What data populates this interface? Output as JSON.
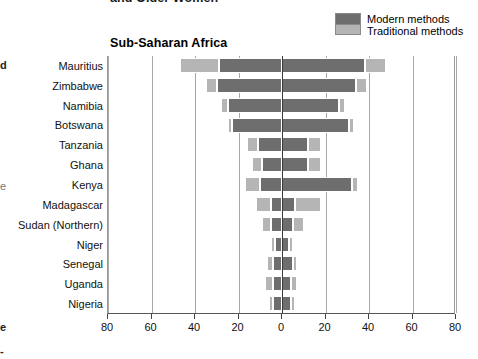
{
  "page": {
    "cutoff_title": "and Older Women",
    "edge_fragments": [
      "d",
      "e",
      "e",
      "-"
    ]
  },
  "legend": {
    "position": "top-right",
    "items": [
      {
        "label": "Modern methods",
        "color": "#6e6e6e",
        "swatch_name": "modern-methods-swatch"
      },
      {
        "label": "Traditional methods",
        "color": "#b5b5b5",
        "swatch_name": "traditional-methods-swatch"
      }
    ]
  },
  "chart_data": {
    "type": "bar",
    "orientation": "horizontal-diverging",
    "title": "Sub-Saharan Africa",
    "xlabel": "",
    "ylabel": "",
    "xlim": [
      -80,
      80
    ],
    "xticks": [
      -80,
      -60,
      -40,
      -20,
      0,
      20,
      40,
      60,
      80
    ],
    "xticklabels": [
      "80",
      "60",
      "40",
      "20",
      "0",
      "20",
      "40",
      "60",
      "80"
    ],
    "grid": true,
    "legend_entries": [
      "Modern methods",
      "Traditional methods"
    ],
    "categories": [
      "Mauritius",
      "Zimbabwe",
      "Namibia",
      "Botswana",
      "Tanzania",
      "Ghana",
      "Kenya",
      "Madagascar",
      "Sudan (Northern)",
      "Niger",
      "Senegal",
      "Uganda",
      "Nigeria"
    ],
    "series": [
      {
        "name": "Modern methods",
        "color": "#6e6e6e",
        "left_values": [
          29.0,
          30.0,
          25.0,
          23.0,
          11.0,
          9.0,
          10.0,
          5.0,
          5.0,
          3.0,
          4.0,
          4.0,
          4.0
        ],
        "right_values": [
          38.0,
          34.0,
          26.0,
          31.0,
          12.0,
          12.0,
          32.0,
          6.0,
          5.0,
          3.0,
          5.0,
          4.0,
          4.0
        ]
      },
      {
        "name": "Traditional methods",
        "color": "#b5b5b5",
        "left_values": [
          18.0,
          5.0,
          3.0,
          2.0,
          5.0,
          5.0,
          7.0,
          7.0,
          4.0,
          2.0,
          3.0,
          4.0,
          2.0
        ],
        "right_values": [
          10.0,
          5.0,
          3.0,
          2.0,
          6.0,
          6.0,
          3.0,
          12.0,
          5.0,
          2.0,
          2.0,
          3.0,
          2.0
        ]
      }
    ]
  }
}
